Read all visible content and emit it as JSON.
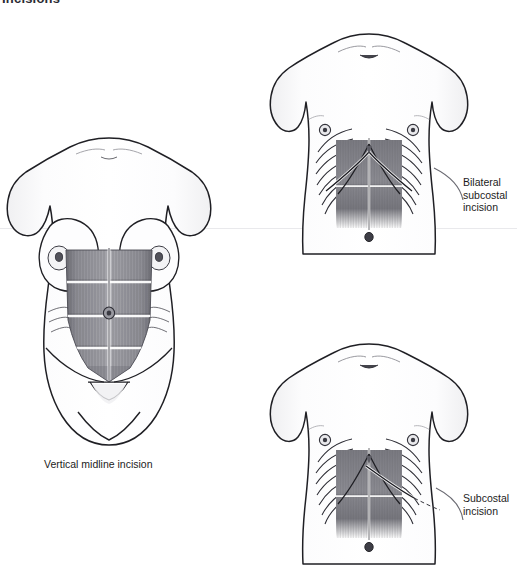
{
  "plate": {
    "title": "Incisions",
    "background_color": "#ffffff",
    "ink_color": "#1a1a1a",
    "muscle_fill_color": "#8d8d93",
    "skin_fill_color": "#fbfbfc"
  },
  "figures": [
    {
      "id": "vertical-midline",
      "subject": "female anterior torso",
      "caption": "Vertical midline incision",
      "incision_type": "vertical midline",
      "structures": [
        "breasts",
        "rectus abdominis",
        "tendinous intersections",
        "umbilicus",
        "linea alba",
        "inguinal fold",
        "pubic region"
      ]
    },
    {
      "id": "bilateral-subcostal",
      "subject": "male anterior torso",
      "caption": "Bilateral\nsubcostal\nincision",
      "incision_type": "bilateral subcostal (chevron / rooftop)",
      "structures": [
        "clavicles",
        "sternal notch",
        "nipples",
        "ribs",
        "costal margin",
        "rectus abdominis",
        "umbilicus"
      ]
    },
    {
      "id": "subcostal",
      "subject": "male anterior torso",
      "caption": "Subcostal\nincision",
      "incision_type": "unilateral right subcostal (Kocher)",
      "structures": [
        "clavicles",
        "sternal notch",
        "nipples",
        "ribs",
        "costal margin",
        "rectus abdominis",
        "umbilicus"
      ]
    }
  ]
}
